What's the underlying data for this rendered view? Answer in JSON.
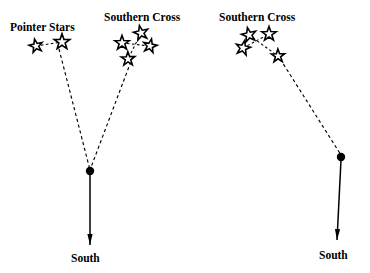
{
  "figure": {
    "background_color": "#ffffff",
    "ink_color": "#000000",
    "width": 370,
    "height": 273
  },
  "labels": {
    "pointer_stars": "Pointer Stars",
    "southern_cross_left": "Southern Cross",
    "southern_cross_right": "Southern Cross",
    "south_left": "South",
    "south_right": "South"
  },
  "chart_data": {
    "type": "diagram",
    "panels": [
      {
        "name": "left-panel",
        "description": "Pointer Stars and Southern Cross converge on a point from which an arrow points to South",
        "constellations": [
          {
            "name": "Pointer Stars",
            "label_position": {
              "x": 10,
              "y": 31
            },
            "stars": [
              {
                "id": "pointer-a",
                "x": 36,
                "y": 46,
                "size": 7.0
              },
              {
                "id": "pointer-b",
                "x": 62,
                "y": 42,
                "size": 8.2
              }
            ],
            "links": [
              {
                "from": "pointer-a",
                "to": "pointer-b"
              }
            ]
          },
          {
            "name": "Southern Cross",
            "label_position": {
              "x": 104,
              "y": 21
            },
            "stars": [
              {
                "id": "cross-top",
                "x": 141,
                "y": 33,
                "size": 7.6
              },
              {
                "id": "cross-left",
                "x": 122,
                "y": 43,
                "size": 7.6
              },
              {
                "id": "cross-right",
                "x": 150,
                "y": 46,
                "size": 7.2
              },
              {
                "id": "cross-bottom",
                "x": 128,
                "y": 59,
                "size": 7.2
              }
            ],
            "links": [
              {
                "from": "cross-left",
                "to": "cross-right"
              },
              {
                "from": "cross-top",
                "to": "cross-bottom"
              }
            ]
          }
        ],
        "sight_lines": [
          {
            "name": "pointer-sight-line",
            "x1": 59,
            "y1": 49,
            "x2": 90,
            "y2": 170
          },
          {
            "name": "cross-sight-line",
            "x1": 133,
            "y1": 56,
            "x2": 90,
            "y2": 170
          }
        ],
        "pivot": {
          "x": 90,
          "y": 171,
          "radius": 4.2
        },
        "arrow": {
          "x1": 90,
          "y1": 174,
          "x2": 90,
          "y2": 245
        },
        "south_label_position": {
          "x": 71,
          "y": 262
        }
      },
      {
        "name": "right-panel",
        "description": "Rotated Southern Cross with a sight line to a point and an arrow pointing to South",
        "constellations": [
          {
            "name": "Southern Cross",
            "label_position": {
              "x": 219,
              "y": 21
            },
            "stars": [
              {
                "id": "r-cross-topleft",
                "x": 249,
                "y": 35,
                "size": 7.6
              },
              {
                "id": "r-cross-topright",
                "x": 269,
                "y": 34,
                "size": 7.6
              },
              {
                "id": "r-cross-left",
                "x": 243,
                "y": 48,
                "size": 7.6
              },
              {
                "id": "r-cross-bottomright",
                "x": 278,
                "y": 56,
                "size": 7.0
              }
            ],
            "links": [
              {
                "from": "r-cross-left",
                "to": "r-cross-topright"
              },
              {
                "from": "r-cross-topleft",
                "to": "r-cross-bottomright"
              }
            ]
          }
        ],
        "sight_lines": [
          {
            "name": "cross-sight-line-right",
            "x1": 277,
            "y1": 54,
            "x2": 341,
            "y2": 155
          }
        ],
        "pivot": {
          "x": 341,
          "y": 157,
          "radius": 4.2
        },
        "arrow": {
          "x1": 341,
          "y1": 160,
          "x2": 337,
          "y2": 240
        },
        "south_label_position": {
          "x": 319,
          "y": 259
        }
      }
    ]
  }
}
